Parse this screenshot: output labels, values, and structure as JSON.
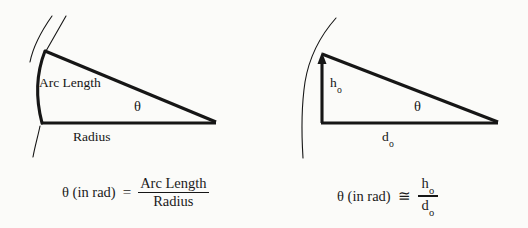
{
  "figure": {
    "background_color": "#fbfbf9",
    "ink_color": "#161616",
    "panels": [
      {
        "id": "arc-length-panel",
        "position": "left",
        "diagram": {
          "type": "circular-sector",
          "description": "Sector of a circle with a thick arc, a horizontal radius, and a slanted radius meeting at the right vertex; angle theta marked at the vertex",
          "apex_point": [
            45,
            51
          ],
          "center_point": [
            215,
            123
          ],
          "base_left_point": [
            42,
            123
          ],
          "labels": {
            "arc": "Arc Length",
            "base": "Radius",
            "angle": "θ"
          }
        },
        "formula": {
          "lhs": "θ (in rad)",
          "relation": "=",
          "numerator": "Arc Length",
          "denominator": "Radius"
        }
      },
      {
        "id": "small-angle-panel",
        "position": "right",
        "diagram": {
          "type": "right-triangle-with-arc",
          "description": "Right triangle with a thick vertical arrow of height h-sub-o, horizontal base d-sub-o, hypotenuse, and a thin arc through the apex; angle theta marked at the right vertex",
          "apex_point": [
            322,
            54
          ],
          "vertex_point": [
            497,
            123
          ],
          "base_left_point": [
            322,
            123
          ],
          "labels": {
            "height": "h",
            "height_subscript": "o",
            "base": "d",
            "base_subscript": "o",
            "angle": "θ"
          }
        },
        "formula": {
          "lhs": "θ (in rad)",
          "relation": "≅",
          "numerator": "h",
          "numerator_subscript": "o",
          "denominator": "d",
          "denominator_subscript": "o"
        }
      }
    ]
  }
}
